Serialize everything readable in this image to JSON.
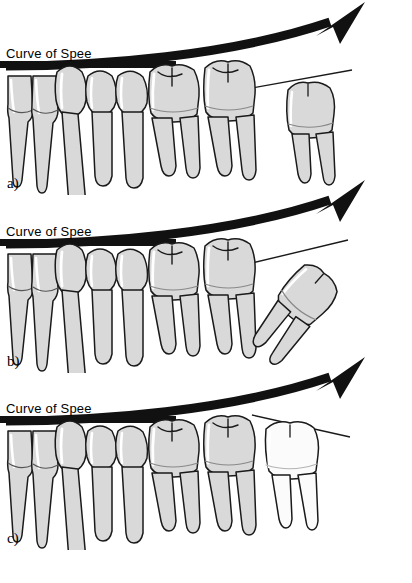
{
  "figure": {
    "background_color": "#ffffff",
    "line_color": "#1a1a1a",
    "tooth_fill": "#d9d9d9",
    "tooth_fill_light": "#fbfbfb",
    "tooth_highlight": "#ffffff",
    "arrow_color": "#111111"
  },
  "panels": [
    {
      "id": "a",
      "label": "a)",
      "curve_label": "Curve of Spee",
      "third_molar_state": "erupted-upright-shaded",
      "third_molar_fill": "#d9d9d9"
    },
    {
      "id": "b",
      "label": "b)",
      "curve_label": "Curve of Spee",
      "third_molar_state": "mesioangular-tilted-shaded",
      "third_molar_fill": "#d9d9d9"
    },
    {
      "id": "c",
      "label": "c)",
      "curve_label": "Curve of Spee",
      "third_molar_state": "upright-unshaded",
      "third_molar_fill": "#fbfbfb"
    }
  ],
  "teeth": {
    "names": [
      "central-incisor",
      "lateral-incisor",
      "canine",
      "first-premolar",
      "second-premolar",
      "first-molar",
      "second-molar",
      "third-molar"
    ]
  },
  "annotations": {
    "occlusal_bar": "curve-of-spee-baseline",
    "curved_arrow": "curve-of-spee-arrow",
    "tangent_line": "distal-tangent-line"
  }
}
